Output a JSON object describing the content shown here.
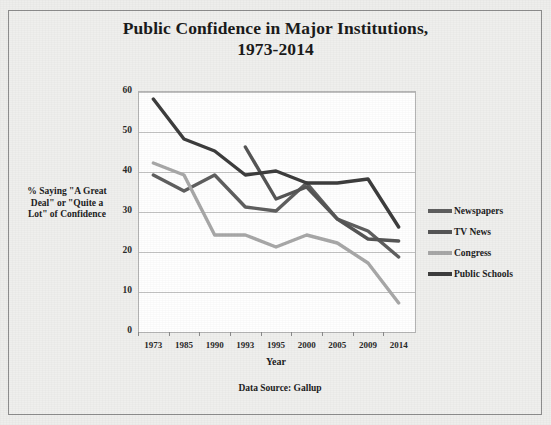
{
  "chart_data": {
    "type": "line",
    "title": "Public Confidence in Major Institutions, 1973-2014",
    "title_line1": "Public Confidence in Major Institutions,",
    "title_line2": "1973-2014",
    "xlabel": "Year",
    "ylabel": "% Saying \"A Great Deal\" or \"Quite a Lot\" of Confidence",
    "ylabel_line1": "% Saying \"A Great",
    "ylabel_line2": "Deal\" or \"Quite a",
    "ylabel_line3": "Lot\" of Confidence",
    "source_note": "Data Source:  Gallup",
    "categories": [
      "1973",
      "1985",
      "1990",
      "1993",
      "1995",
      "2000",
      "2005",
      "2009",
      "2014"
    ],
    "ylim": [
      0,
      60
    ],
    "yticks": [
      0,
      10,
      20,
      30,
      40,
      50,
      60
    ],
    "grid": true,
    "legend_position": "right",
    "series": [
      {
        "name": "Newspapers",
        "color": "#5f5f5f",
        "values": [
          39,
          35,
          39,
          31,
          30,
          37,
          28,
          25,
          18.5
        ]
      },
      {
        "name": "TV News",
        "color": "#565656",
        "values": [
          null,
          null,
          null,
          46,
          33,
          36,
          28,
          23,
          22.5
        ]
      },
      {
        "name": "Congress",
        "color": "#a8a8a8",
        "values": [
          42,
          39,
          24,
          24,
          21,
          24,
          22,
          17,
          7
        ]
      },
      {
        "name": "Public Schools",
        "color": "#3d3d3d",
        "values": [
          58,
          48,
          45,
          39,
          40,
          37,
          37,
          38,
          26
        ]
      }
    ]
  },
  "legend": {
    "items": [
      {
        "label": "Newspapers",
        "color": "#5f5f5f"
      },
      {
        "label": "TV News",
        "color": "#565656"
      },
      {
        "label": "Congress",
        "color": "#a8a8a8"
      },
      {
        "label": "Public Schools",
        "color": "#3d3d3d"
      }
    ]
  }
}
